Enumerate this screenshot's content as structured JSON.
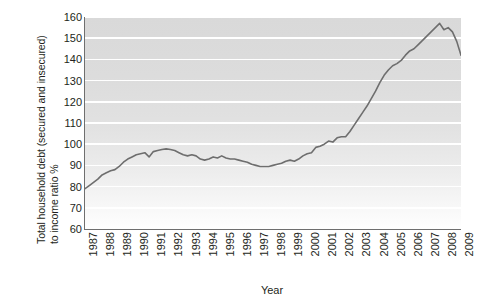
{
  "chart_data": {
    "type": "line",
    "title": "",
    "subtitle": "",
    "xlabel": "Year",
    "ylabel": "Total household debt (secured and insecured) to income ratio %",
    "ylabel_line_1": "Total household debt (secured and insecured)",
    "ylabel_line_2": "to income ratio %",
    "xlim": [
      1987,
      2009
    ],
    "ylim": [
      60,
      160
    ],
    "ytick_labels": [
      "160",
      "150",
      "140",
      "130",
      "120",
      "110",
      "100",
      "90",
      "80",
      "70",
      "60"
    ],
    "ytick_values": [
      160,
      150,
      140,
      130,
      120,
      110,
      100,
      90,
      80,
      70,
      60
    ],
    "xtick_labels": [
      "1987",
      "1988",
      "1989",
      "1990",
      "1991",
      "1992",
      "1993",
      "1994",
      "1995",
      "1996",
      "1997",
      "1998",
      "1999",
      "2000",
      "2001",
      "2002",
      "2003",
      "2004",
      "2005",
      "2006",
      "2007",
      "2008",
      "2009"
    ],
    "grid": true,
    "grid_orientation": "horizontal",
    "grid_color": "#ffffff",
    "legend": false,
    "legend_position": "none",
    "line_color": "#6e6e6e",
    "line_width": 1.6,
    "plot_background": "vertical gradient light grey to white",
    "series": [
      {
        "name": "Total household debt to income ratio",
        "x": [
          1987.0,
          1987.25,
          1987.5,
          1987.75,
          1988.0,
          1988.25,
          1988.5,
          1988.75,
          1989.0,
          1989.25,
          1989.5,
          1989.75,
          1990.0,
          1990.25,
          1990.5,
          1990.75,
          1991.0,
          1991.25,
          1991.5,
          1991.75,
          1992.0,
          1992.25,
          1992.5,
          1992.75,
          1993.0,
          1993.25,
          1993.5,
          1993.75,
          1994.0,
          1994.25,
          1994.5,
          1994.75,
          1995.0,
          1995.25,
          1995.5,
          1995.75,
          1996.0,
          1996.25,
          1996.5,
          1996.75,
          1997.0,
          1997.25,
          1997.5,
          1997.75,
          1998.0,
          1998.25,
          1998.5,
          1998.75,
          1999.0,
          1999.25,
          1999.5,
          1999.75,
          2000.0,
          2000.25,
          2000.5,
          2000.75,
          2001.0,
          2001.25,
          2001.5,
          2001.75,
          2002.0,
          2002.25,
          2002.5,
          2002.75,
          2003.0,
          2003.25,
          2003.5,
          2003.75,
          2004.0,
          2004.25,
          2004.5,
          2004.75,
          2005.0,
          2005.25,
          2005.5,
          2005.75,
          2006.0,
          2006.25,
          2006.5,
          2006.75,
          2007.0,
          2007.25,
          2007.5,
          2007.75,
          2008.0,
          2008.25,
          2008.5,
          2008.75,
          2009.0
        ],
        "values": [
          79.0,
          80.5,
          82.0,
          83.5,
          85.5,
          86.5,
          87.5,
          88.0,
          89.5,
          91.5,
          93.0,
          94.0,
          95.0,
          95.5,
          96.0,
          94.0,
          96.5,
          97.0,
          97.5,
          97.8,
          97.5,
          97.0,
          96.0,
          95.0,
          94.5,
          95.0,
          94.5,
          93.0,
          92.5,
          93.0,
          94.0,
          93.5,
          94.5,
          93.5,
          93.0,
          93.0,
          92.5,
          92.0,
          91.5,
          90.5,
          90.0,
          89.5,
          89.5,
          89.5,
          90.0,
          90.5,
          91.0,
          92.0,
          92.5,
          92.0,
          93.0,
          94.5,
          95.5,
          96.0,
          98.5,
          99.0,
          100.0,
          101.5,
          101.0,
          103.0,
          103.5,
          103.5,
          106.0,
          109.0,
          112.0,
          115.0,
          118.0,
          121.5,
          125.0,
          129.0,
          132.5,
          135.0,
          137.0,
          138.0,
          139.5,
          142.0,
          144.0,
          145.0,
          147.0,
          149.0,
          151.0,
          153.0,
          155.0,
          157.0,
          154.0,
          155.0,
          153.0,
          148.5,
          142.0
        ]
      }
    ]
  }
}
